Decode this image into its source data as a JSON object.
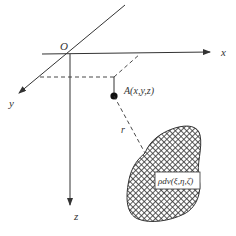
{
  "diagram": {
    "axes": {
      "origin_label": "O",
      "x_label": "x",
      "y_label": "y",
      "z_label": "z"
    },
    "point": {
      "label": "A(x,y,z)"
    },
    "distance": {
      "label": "r"
    },
    "volume_element": {
      "label": "ρdv(ξ,η,ζ)"
    },
    "colors": {
      "line": "#333333",
      "hatch": "#444444",
      "background": "#ffffff"
    }
  }
}
